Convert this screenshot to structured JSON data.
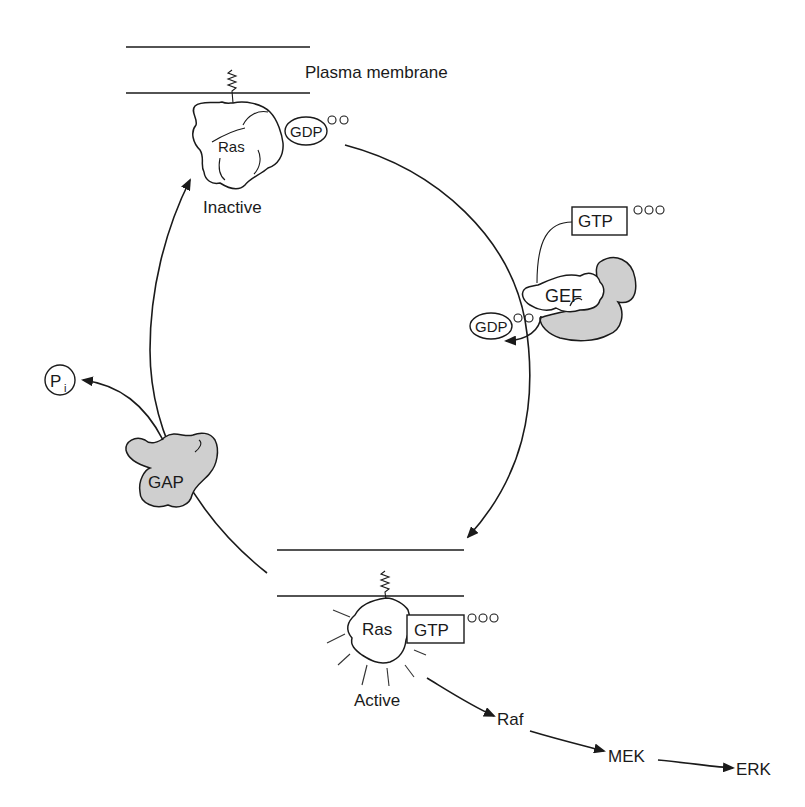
{
  "diagram": {
    "colors": {
      "ink": "#1a1a1a",
      "protein_shaded": "#cfcfcf",
      "background": "#ffffff"
    },
    "membrane_top": {
      "label": "Plasma membrane"
    },
    "inactive_state": {
      "protein": "Ras",
      "nucleotide": "GDP",
      "phosphates": "○○",
      "state_label": "Inactive"
    },
    "gef": {
      "label": "GEF",
      "incoming": "GTP",
      "incoming_phosphates": "○○○",
      "released": "GDP",
      "released_phosphates": "○○"
    },
    "gap": {
      "label": "GAP",
      "released": "P",
      "released_subscript": "i"
    },
    "active_state": {
      "protein": "Ras",
      "nucleotide": "GTP",
      "phosphates": "○○○",
      "state_label": "Active"
    },
    "cascade": [
      "Raf",
      "MEK",
      "ERK"
    ]
  }
}
